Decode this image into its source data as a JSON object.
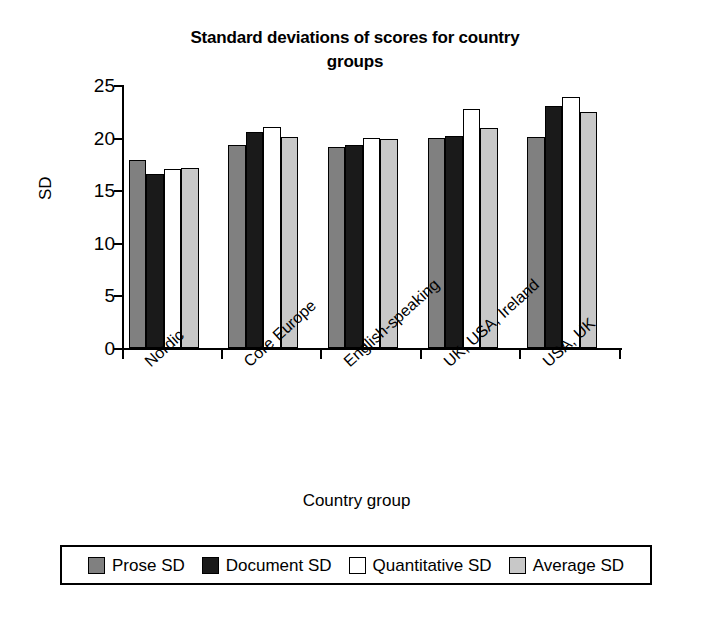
{
  "chart_data": {
    "type": "bar",
    "title": "Standard deviations of scores for country groups",
    "title_line1": "Standard deviations of scores for country",
    "title_line2": "groups",
    "xlabel": "Country group",
    "ylabel": "SD",
    "ylim": [
      0,
      25
    ],
    "ytick_values": [
      0,
      5,
      10,
      15,
      20,
      25
    ],
    "ytick_labels": [
      "0",
      "5",
      "10",
      "15",
      "20",
      "25"
    ],
    "grid": false,
    "legend_position": "bottom",
    "categories": [
      "Nordic",
      "Core Europe",
      "English-speaking",
      "UK, USA, Ireland",
      "USA, UK"
    ],
    "series": [
      {
        "name": "Prose SD",
        "color": "#808080",
        "values": [
          17.9,
          19.3,
          19.1,
          20.0,
          20.1
        ]
      },
      {
        "name": "Document SD",
        "color": "#1a1a1a",
        "values": [
          16.5,
          20.5,
          19.3,
          20.2,
          23.0
        ]
      },
      {
        "name": "Quantitative SD",
        "color": "#ffffff",
        "values": [
          17.0,
          21.0,
          20.0,
          22.7,
          23.9
        ]
      },
      {
        "name": "Average SD",
        "color": "#c8c8c8",
        "values": [
          17.1,
          20.1,
          19.9,
          20.9,
          22.4
        ]
      }
    ]
  },
  "legend": {
    "items": [
      {
        "label": "Prose SD",
        "color": "#808080"
      },
      {
        "label": "Document SD",
        "color": "#1a1a1a"
      },
      {
        "label": "Quantitative SD",
        "color": "#ffffff"
      },
      {
        "label": "Average SD",
        "color": "#c8c8c8"
      }
    ]
  }
}
